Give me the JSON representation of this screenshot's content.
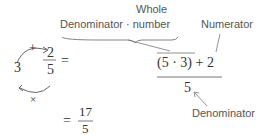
{
  "diagram": {
    "left": {
      "whole": "3",
      "numerator": "2",
      "denominator": "5",
      "equals": "=",
      "plus_sign": "+",
      "times_sign": "×"
    },
    "expression": {
      "numerator": "(5 · 3) + 2",
      "denominator": "5"
    },
    "result": {
      "equals": "=",
      "numerator": "17",
      "denominator": "5"
    },
    "labels": {
      "whole_line1": "Whole",
      "whole_line2": "Denominator · number",
      "numerator": "Numerator",
      "denominator": "Denominator"
    }
  }
}
